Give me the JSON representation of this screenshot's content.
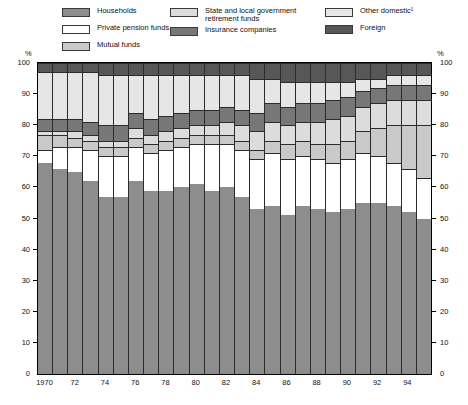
{
  "legend": {
    "columns": [
      {
        "items": [
          {
            "label": "Households",
            "color": "#8d8d8d",
            "name": "households"
          },
          {
            "label": "Private pension funds",
            "color": "#ffffff",
            "name": "private-pension-funds"
          },
          {
            "label": "Mutual funds",
            "color": "#c9c9c9",
            "name": "mutual-funds"
          }
        ]
      },
      {
        "items": [
          {
            "label": "State and local government\nretirement funds",
            "color": "#dcdcdc",
            "name": "state-local-government-retirement-funds"
          },
          {
            "label": "Insurance companies",
            "color": "#777777",
            "name": "insurance-companies"
          }
        ]
      },
      {
        "items": [
          {
            "label": "Other domestic¹",
            "color": "#e6e6e6",
            "name": "other-domestic"
          },
          {
            "label": "Foreign",
            "color": "#575757",
            "name": "foreign"
          }
        ]
      }
    ]
  },
  "axis": {
    "unit_left": "%",
    "unit_right": "%",
    "y_ticks": [
      "100",
      "90",
      "80",
      "70",
      "60",
      "50",
      "40",
      "30",
      "20",
      "10",
      "0"
    ],
    "x_ticks": [
      "1970",
      "72",
      "74",
      "76",
      "78",
      "80",
      "82",
      "84",
      "86",
      "88",
      "90",
      "92",
      "94"
    ]
  },
  "chart_data": {
    "type": "bar",
    "title": "",
    "subtitle": "",
    "xlabel": "",
    "ylabel": "%",
    "ylim": [
      0,
      100
    ],
    "grid": false,
    "stacked": true,
    "stack_order_bottom_to_top": [
      "Households",
      "Private pension funds",
      "Mutual funds",
      "State and local government retirement funds",
      "Insurance companies",
      "Other domestic¹",
      "Foreign"
    ],
    "legend_position": "top",
    "categories": [
      "1970",
      "1971",
      "1972",
      "1973",
      "1974",
      "1975",
      "1976",
      "1977",
      "1978",
      "1979",
      "1980",
      "1981",
      "1982",
      "1983",
      "1984",
      "1985",
      "1986",
      "1987",
      "1988",
      "1989",
      "1990",
      "1991",
      "1992",
      "1993",
      "1994",
      "1995"
    ],
    "series": [
      {
        "name": "Households",
        "color": "#8d8d8d",
        "values": [
          68,
          66,
          65,
          62,
          57,
          57,
          62,
          59,
          59,
          60,
          61,
          59,
          60,
          57,
          53,
          54,
          51,
          54,
          53,
          52,
          53,
          55,
          55,
          54,
          52,
          50
        ]
      },
      {
        "name": "Private pension funds",
        "color": "#ffffff",
        "values": [
          4,
          7,
          8,
          10,
          13,
          13,
          11,
          12,
          13,
          13,
          13,
          15,
          14,
          15,
          16,
          17,
          18,
          16,
          16,
          16,
          16,
          16,
          15,
          14,
          14,
          13
        ]
      },
      {
        "name": "Mutual funds",
        "color": "#c9c9c9",
        "values": [
          5,
          4,
          3,
          3,
          3,
          3,
          3,
          3,
          3,
          3,
          3,
          3,
          3,
          3,
          3,
          4,
          5,
          5,
          5,
          6,
          6,
          7,
          9,
          12,
          14,
          17
        ]
      },
      {
        "name": "State and local government retirement funds",
        "color": "#dcdcdc",
        "values": [
          1,
          1,
          2,
          2,
          2,
          2,
          3,
          3,
          3,
          3,
          3,
          3,
          4,
          5,
          6,
          6,
          6,
          6,
          7,
          8,
          8,
          8,
          8,
          8,
          8,
          8
        ]
      },
      {
        "name": "Insurance companies",
        "color": "#777777",
        "values": [
          4,
          4,
          4,
          4,
          5,
          5,
          5,
          5,
          5,
          5,
          5,
          5,
          5,
          5,
          6,
          6,
          6,
          6,
          6,
          6,
          6,
          5,
          5,
          5,
          5,
          5
        ]
      },
      {
        "name": "Other domestic¹",
        "color": "#e6e6e6",
        "values": [
          15,
          15,
          15,
          16,
          16,
          16,
          12,
          14,
          13,
          12,
          11,
          11,
          10,
          11,
          11,
          8,
          8,
          7,
          7,
          6,
          5,
          4,
          3,
          3,
          3,
          3
        ]
      },
      {
        "name": "Foreign",
        "color": "#575757",
        "values": [
          3,
          3,
          3,
          3,
          4,
          4,
          4,
          4,
          4,
          4,
          4,
          4,
          4,
          4,
          5,
          5,
          6,
          6,
          6,
          6,
          6,
          5,
          5,
          4,
          4,
          4
        ]
      }
    ],
    "footnote_marker": "1"
  }
}
